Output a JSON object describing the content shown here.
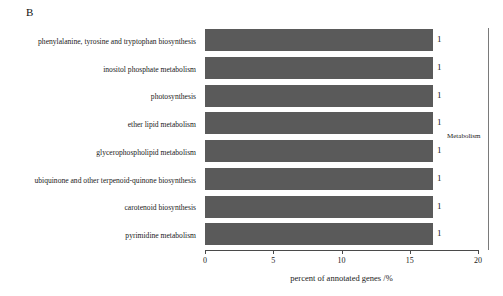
{
  "panel": {
    "letter": "B"
  },
  "chart_data": {
    "type": "bar",
    "orientation": "horizontal",
    "title": "",
    "subtitle": "",
    "xlabel": "percent of annotated genes /%",
    "ylabel": "",
    "xlim": [
      0,
      20
    ],
    "xticks": [
      0,
      5,
      10,
      15,
      20
    ],
    "xtick_labels": [
      "0",
      "5",
      "10",
      "15",
      "20"
    ],
    "grid": false,
    "legend": "none",
    "bar_color": "#5a5a5a",
    "categories": [
      "phenylalanine, tyrosine and tryptophan biosynthesis",
      "inositol phosphate metabolism",
      "photosynthesis",
      "ether lipid metabolism",
      "glycerophospholipid metabolism",
      "ubiquinone and other terpenoid-quinone biosynthesis",
      "carotenoid biosynthesis",
      "pyrimidine metabolism"
    ],
    "values": [
      16.7,
      16.7,
      16.7,
      16.7,
      16.7,
      16.7,
      16.7,
      16.7
    ],
    "value_labels": [
      "1",
      "1",
      "1",
      "1",
      "1",
      "1",
      "1",
      "1"
    ],
    "annotations": [
      {
        "text": "Metabolism",
        "role": "group-bracket-label"
      }
    ]
  }
}
